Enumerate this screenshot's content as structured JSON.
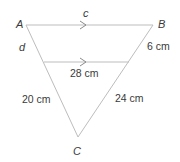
{
  "diagram": {
    "type": "triangle-with-parallel-line",
    "colors": {
      "lines": "#bdbdbd",
      "arrows": "#8a8a8a",
      "text": "#3a3a3a"
    },
    "vertices": {
      "A": {
        "label": "A",
        "x": 26,
        "y": 25
      },
      "B": {
        "label": "B",
        "x": 153,
        "y": 25
      },
      "C": {
        "label": "C",
        "x": 78,
        "y": 137
      }
    },
    "parallel_segment": {
      "x1": 44,
      "x2": 129,
      "y": 62
    },
    "labels": {
      "A": "A",
      "B": "B",
      "C": "C",
      "c": "c",
      "d": "d",
      "side_b_upper": "6 cm",
      "parallel_length": "28 cm",
      "side_a_lower": "20 cm",
      "side_b_lower": "24 cm"
    },
    "parallel_markers": [
      "arrow-on-AB",
      "arrow-on-inner-segment"
    ]
  }
}
